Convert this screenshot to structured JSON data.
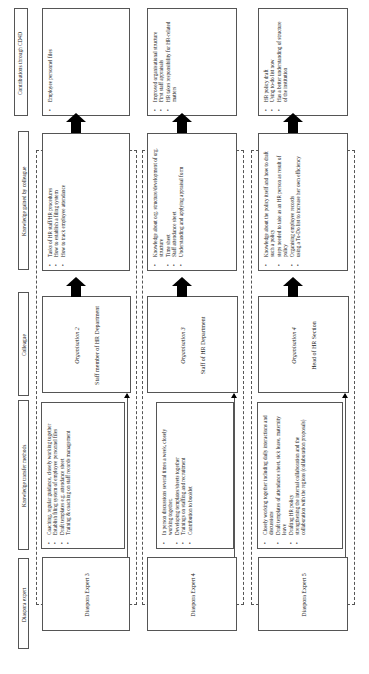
{
  "headers": [
    "Diaspora expert",
    "Knowledge transfer methods",
    "Colleague",
    "Knowledge gained by colleague",
    "Contributions through CD4D"
  ],
  "rows": [
    {
      "expert": "Diaspora Expert 3",
      "methods": [
        "Coaching, regular guidance, closely working together",
        "Establish filing system of employee personnel files",
        "Draft templates e.g. attendance sheet",
        "Training & coaching on staff records management"
      ],
      "org": "Organisation 2",
      "colleague": "Staff member of HR Department",
      "knowledge": [
        "Tasks of HR staff/HR procedures",
        "How to establish a filing system",
        "How to track employee attendance"
      ],
      "contrib": [
        "Employee personnel files"
      ]
    },
    {
      "expert": "Diaspora Expert 4",
      "methods": [
        "In person discussions several times a week, closely working together,",
        "Developing templates/sheets together",
        "Trainings on staffing and recruitment",
        "Contribution to booklet"
      ],
      "org": "Organisation 3",
      "colleague": "Staff of HR Department",
      "knowledge": [
        "Knowledge about org. structure/development of org. structure",
        "Time sheet",
        "Staff attendance sheet",
        "Understanding and applying appraisal form"
      ],
      "contrib": [
        "Improved organisational structure",
        "First staff appraisals",
        "HR takes responsibility for HR-related matters"
      ]
    },
    {
      "expert": "Diaspora Expert 5",
      "methods": [
        "Closely working together including daily interactions and discussions",
        "Draft templates of attendance sheet, sick leave, maternity leave",
        "Drafting HR policy",
        "strengthening the internal collaboration and the collaboration with the regions (collaboration proposals)"
      ],
      "org": "Organisation 4",
      "colleague": "Head of HR Section",
      "knowledge": [
        "Knowledge about the policy itself and how to draft such a policy",
        "steps needed to take as an HR person as result of policy",
        "Organising employee records",
        "using a To-Do list to increase her own efficiency"
      ],
      "contrib": [
        "HR policy draft",
        "Using to-do list now",
        "Has a better understanding of structure of the institution"
      ]
    }
  ]
}
